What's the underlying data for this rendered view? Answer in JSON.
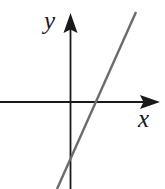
{
  "figure": {
    "name": "cartesian-linear-graph",
    "background_color": "#ffffff",
    "width": 165,
    "height": 189
  },
  "axes": {
    "x": {
      "label": "x",
      "color": "#1a1a1a",
      "origin_y": 102,
      "start_x": 0,
      "end_x": 160,
      "arrow": "right-arrowhead"
    },
    "y": {
      "label": "y",
      "color": "#1a1a1a",
      "origin_x": 70,
      "start_y": 189,
      "end_y": 13,
      "arrow": "up-arrowhead"
    }
  },
  "chart_data": {
    "type": "line",
    "title": "",
    "xlabel": "x",
    "ylabel": "y",
    "grid": false,
    "legend": null,
    "axis_style": "arrowed-cartesian-axes",
    "ticks": {
      "x": [],
      "y": []
    },
    "series": [
      {
        "name": "line",
        "color": "#6b6b6b",
        "line_width": 2.4,
        "description": "straight line with positive slope crossing x-axis right of origin and y-axis below origin",
        "slope": 2.24,
        "x_intercept_px": 95,
        "y_intercept_px": 149,
        "endpoints_px": [
          {
            "x": 136,
            "y": 12
          },
          {
            "x": 57,
            "y": 189
          }
        ]
      }
    ]
  }
}
